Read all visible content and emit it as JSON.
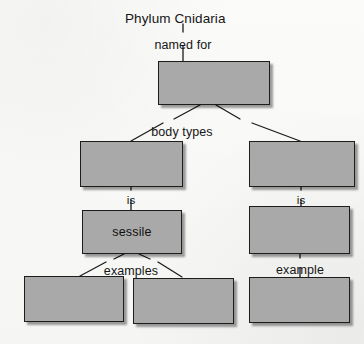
{
  "worksheet": {
    "title": "Phylum Cnidaria",
    "root_link": "named for",
    "background_color": "#f8f8f7",
    "box_fill_color": "#a9a9a9",
    "box_border_color": "#1d1d1d",
    "text_color": "#151515"
  },
  "nodes": [
    {
      "id": "root-box",
      "label": "",
      "x": 158,
      "y": 61,
      "w": 112,
      "h": 44
    },
    {
      "id": "polyp-box",
      "label": "",
      "x": 80,
      "y": 141,
      "w": 103,
      "h": 46
    },
    {
      "id": "medusa-box",
      "label": "",
      "x": 249,
      "y": 141,
      "w": 106,
      "h": 46
    },
    {
      "id": "sessile-box",
      "label": "sessile",
      "x": 82,
      "y": 210,
      "w": 100,
      "h": 44
    },
    {
      "id": "motile-box",
      "label": "",
      "x": 249,
      "y": 206,
      "w": 101,
      "h": 48
    },
    {
      "id": "example-box-1",
      "label": "",
      "x": 24,
      "y": 276,
      "w": 100,
      "h": 46
    },
    {
      "id": "example-box-2",
      "label": "",
      "x": 133,
      "y": 278,
      "w": 101,
      "h": 46
    },
    {
      "id": "example-box-3",
      "label": "",
      "x": 249,
      "y": 277,
      "w": 101,
      "h": 46
    }
  ],
  "link_labels": [
    {
      "id": "link-named-for",
      "text": "named for",
      "x": 183,
      "y": 39
    },
    {
      "id": "link-body-types",
      "text": "body types",
      "x": 182,
      "y": 126
    },
    {
      "id": "link-is-left",
      "text": "is",
      "x": 131,
      "y": 195
    },
    {
      "id": "link-is-right",
      "text": "is",
      "x": 301,
      "y": 195
    },
    {
      "id": "link-examples",
      "text": "examples",
      "x": 131,
      "y": 265
    },
    {
      "id": "link-example",
      "text": "example",
      "x": 300,
      "y": 264
    }
  ],
  "connectors": [
    {
      "id": "connector-title-to-namedfor",
      "x1": 183,
      "y1": 24,
      "x2": 183,
      "y2": 32
    },
    {
      "id": "connector-namedfor-to-root",
      "x1": 183,
      "y1": 46,
      "x2": 183,
      "y2": 61
    },
    {
      "id": "connector-root-to-bodytypes-left",
      "x1": 200,
      "y1": 105,
      "x2": 174,
      "y2": 119
    },
    {
      "id": "connector-root-to-bodytypes-right",
      "x1": 216,
      "y1": 105,
      "x2": 240,
      "y2": 119
    },
    {
      "id": "connector-bodytypes-to-polyp",
      "x1": 163,
      "y1": 123,
      "x2": 131,
      "y2": 141
    },
    {
      "id": "connector-bodytypes-to-medusa",
      "x1": 252,
      "y1": 123,
      "x2": 300,
      "y2": 141
    },
    {
      "id": "connector-polyp-to-is",
      "x1": 131,
      "y1": 187,
      "x2": 131,
      "y2": 190
    },
    {
      "id": "connector-is-to-sessile",
      "x1": 131,
      "y1": 200,
      "x2": 131,
      "y2": 210
    },
    {
      "id": "connector-medusa-to-is",
      "x1": 301,
      "y1": 187,
      "x2": 301,
      "y2": 190
    },
    {
      "id": "connector-is-to-motile",
      "x1": 301,
      "y1": 200,
      "x2": 301,
      "y2": 206
    },
    {
      "id": "connector-sessile-to-examples-left",
      "x1": 124,
      "y1": 254,
      "x2": 114,
      "y2": 259
    },
    {
      "id": "connector-sessile-to-examples-right",
      "x1": 139,
      "y1": 254,
      "x2": 150,
      "y2": 259
    },
    {
      "id": "connector-examples-to-box1",
      "x1": 106,
      "y1": 262,
      "x2": 80,
      "y2": 276
    },
    {
      "id": "connector-examples-to-box2",
      "x1": 158,
      "y1": 262,
      "x2": 182,
      "y2": 277
    },
    {
      "id": "connector-motile-to-example",
      "x1": 300,
      "y1": 254,
      "x2": 300,
      "y2": 258
    },
    {
      "id": "connector-example-to-box3",
      "x1": 300,
      "y1": 268,
      "x2": 300,
      "y2": 277
    }
  ]
}
